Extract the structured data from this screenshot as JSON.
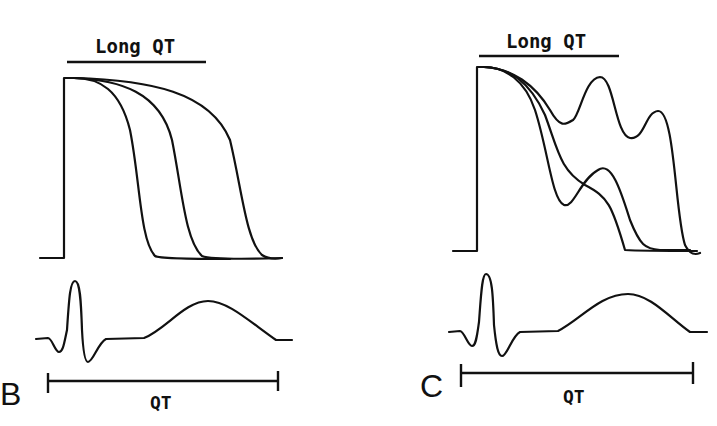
{
  "figure": {
    "panels": [
      {
        "id": "B",
        "letter": "B",
        "condition_label": "Long QT",
        "interval_label": "QT",
        "action_potentials": {
          "count": 3,
          "description": "Three progressively prolonged action potentials with smooth repolarization"
        },
        "ecg": {
          "waves": [
            "Q",
            "R",
            "S",
            "T"
          ]
        }
      },
      {
        "id": "C",
        "letter": "C",
        "condition_label": "Long QT",
        "interval_label": "QT",
        "action_potentials": {
          "count": 3,
          "description": "Three prolonged action potentials with early afterdepolarizations (oscillations during repolarization)"
        },
        "ecg": {
          "waves": [
            "Q",
            "R",
            "S",
            "T"
          ]
        }
      }
    ],
    "colors": {
      "ink": "#111111",
      "background": "#ffffff"
    }
  }
}
